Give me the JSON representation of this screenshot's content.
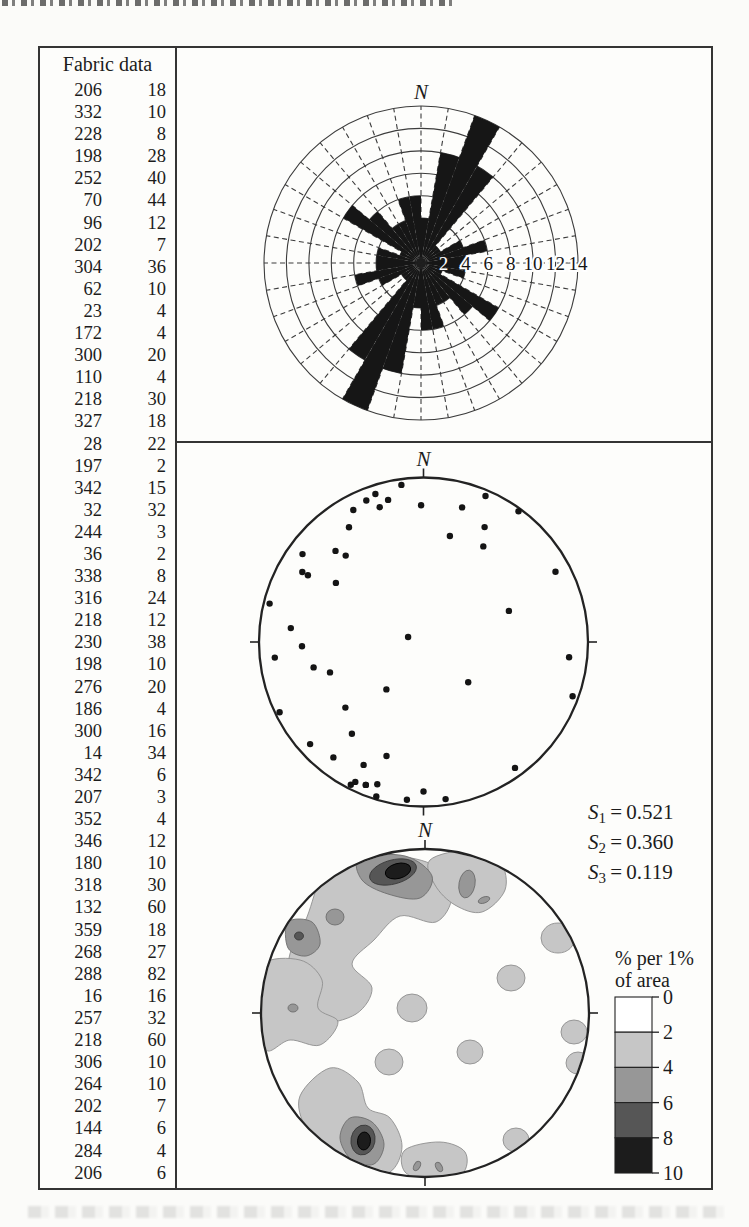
{
  "north_label": "N",
  "figure": {
    "table": {
      "title": "Fabric data",
      "rows": [
        [
          206,
          18
        ],
        [
          332,
          10
        ],
        [
          228,
          8
        ],
        [
          198,
          28
        ],
        [
          252,
          40
        ],
        [
          70,
          44
        ],
        [
          96,
          12
        ],
        [
          202,
          7
        ],
        [
          304,
          36
        ],
        [
          62,
          10
        ],
        [
          23,
          4
        ],
        [
          172,
          4
        ],
        [
          300,
          20
        ],
        [
          110,
          4
        ],
        [
          218,
          30
        ],
        [
          327,
          18
        ],
        [
          28,
          22
        ],
        [
          197,
          2
        ],
        [
          342,
          15
        ],
        [
          32,
          32
        ],
        [
          244,
          3
        ],
        [
          36,
          2
        ],
        [
          338,
          8
        ],
        [
          316,
          24
        ],
        [
          218,
          12
        ],
        [
          230,
          38
        ],
        [
          198,
          10
        ],
        [
          276,
          20
        ],
        [
          186,
          4
        ],
        [
          300,
          16
        ],
        [
          14,
          34
        ],
        [
          342,
          6
        ],
        [
          207,
          3
        ],
        [
          352,
          4
        ],
        [
          346,
          12
        ],
        [
          180,
          10
        ],
        [
          318,
          30
        ],
        [
          132,
          60
        ],
        [
          359,
          18
        ],
        [
          268,
          27
        ],
        [
          288,
          82
        ],
        [
          16,
          16
        ],
        [
          257,
          32
        ],
        [
          218,
          60
        ],
        [
          306,
          10
        ],
        [
          264,
          10
        ],
        [
          202,
          7
        ],
        [
          144,
          6
        ],
        [
          284,
          4
        ],
        [
          206,
          6
        ]
      ]
    },
    "stats": [
      {
        "base": "S",
        "sub": "1",
        "value": "0.521"
      },
      {
        "base": "S",
        "sub": "2",
        "value": "0.360"
      },
      {
        "base": "S",
        "sub": "3",
        "value": "0.119"
      }
    ],
    "legend": {
      "title_line1": "% per 1%",
      "title_line2": "of area",
      "tick_labels": [
        "0",
        "2",
        "4",
        "6",
        "8",
        "10"
      ],
      "box_colors": [
        "#ffffff",
        "#c6c6c6",
        "#979797",
        "#565656",
        "#1c1c1c"
      ]
    }
  },
  "chart_data": [
    {
      "type": "bar",
      "subtype": "rose-diagram",
      "polar": true,
      "symmetric_axial": true,
      "title": "Rose diagram of fabric azimuths",
      "bin_width_deg": 10,
      "bin_start_deg": [
        0,
        10,
        20,
        30,
        40,
        50,
        60,
        70,
        80,
        90,
        100,
        110,
        120,
        130,
        140,
        150,
        160,
        170
      ],
      "percent_per_bin": [
        4,
        10,
        14,
        10,
        2,
        2,
        4,
        6,
        4,
        4,
        4,
        2,
        8,
        6,
        4,
        4,
        6,
        6
      ],
      "radial_ticks": [
        2,
        4,
        6,
        8,
        10,
        12,
        14
      ],
      "radial_tick_labels": [
        "2",
        "4",
        "6",
        "8",
        "10",
        "12",
        "14"
      ],
      "north_label": "N",
      "grid": "dashed radial spokes every 10 deg, solid rings every 2%"
    },
    {
      "type": "scatter",
      "subtype": "equal-area-stereonet-lower-hemisphere",
      "title": "Point plot of lineations (trend, plunge)",
      "north_label": "N",
      "points_trend_plunge": [
        [
          206,
          18
        ],
        [
          332,
          10
        ],
        [
          228,
          8
        ],
        [
          198,
          28
        ],
        [
          252,
          40
        ],
        [
          70,
          44
        ],
        [
          96,
          12
        ],
        [
          202,
          7
        ],
        [
          304,
          36
        ],
        [
          62,
          10
        ],
        [
          23,
          4
        ],
        [
          172,
          4
        ],
        [
          300,
          20
        ],
        [
          110,
          4
        ],
        [
          218,
          30
        ],
        [
          327,
          18
        ],
        [
          28,
          22
        ],
        [
          197,
          2
        ],
        [
          342,
          15
        ],
        [
          32,
          32
        ],
        [
          244,
          3
        ],
        [
          36,
          2
        ],
        [
          338,
          8
        ],
        [
          316,
          24
        ],
        [
          218,
          12
        ],
        [
          230,
          38
        ],
        [
          198,
          10
        ],
        [
          276,
          20
        ],
        [
          186,
          4
        ],
        [
          300,
          16
        ],
        [
          14,
          34
        ],
        [
          342,
          6
        ],
        [
          207,
          3
        ],
        [
          352,
          4
        ],
        [
          346,
          12
        ],
        [
          180,
          10
        ],
        [
          318,
          30
        ],
        [
          132,
          60
        ],
        [
          359,
          18
        ],
        [
          268,
          27
        ],
        [
          288,
          82
        ],
        [
          16,
          16
        ],
        [
          257,
          32
        ],
        [
          218,
          60
        ],
        [
          306,
          10
        ],
        [
          264,
          10
        ],
        [
          202,
          7
        ],
        [
          144,
          6
        ],
        [
          284,
          4
        ],
        [
          206,
          6
        ]
      ]
    },
    {
      "type": "heatmap",
      "subtype": "contoured-stereonet",
      "title": "Contoured density of fabric data",
      "north_label": "N",
      "levels_percent_per_1pct_area": [
        0,
        2,
        4,
        6,
        8,
        10
      ],
      "legend_title": "% per 1% of area",
      "level_colors": [
        "#ffffff",
        "#c6c6c6",
        "#979797",
        "#565656",
        "#1c1c1c"
      ],
      "stats": {
        "S1": 0.521,
        "S2": 0.36,
        "S3": 0.119
      }
    }
  ]
}
